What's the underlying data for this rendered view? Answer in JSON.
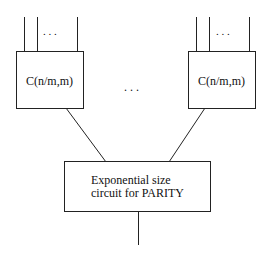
{
  "diagram": {
    "left_subcircuit": {
      "label": "C(n/m,m)",
      "input_ellipsis": ". . ."
    },
    "right_subcircuit": {
      "label": "C(n/m,m)",
      "input_ellipsis": ". . ."
    },
    "middle_ellipsis": ". . .",
    "parity_circuit": {
      "line1": "Exponential size",
      "line2": "circuit for PARITY"
    },
    "colors": {
      "stroke": "#222222",
      "background": "#ffffff"
    }
  }
}
